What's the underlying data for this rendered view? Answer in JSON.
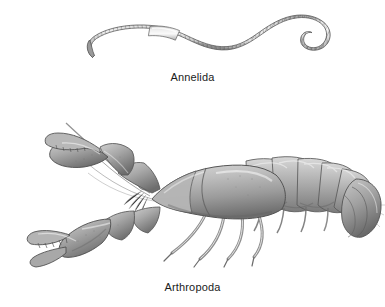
{
  "figure": {
    "kind": "biology-illustration-plate",
    "background_color": "#ffffff",
    "ink_color": "#1b1b1b",
    "panel_count": 2
  },
  "panels": [
    {
      "id": "annelida",
      "caption": "Annelida",
      "common_name": "earthworm",
      "icon_name": "earthworm-illustration",
      "orientation": "horizontal-sinusoid",
      "palette": {
        "body_light": "#e8e8e8",
        "body_mid": "#b4b4b4",
        "body_dark": "#7d7d7d",
        "outline": "#555555",
        "clitellum": "#f0f0f0"
      },
      "features": [
        "tapered anterior end at left",
        "annular ring segments along entire body",
        "smooth pale clitellum band near anterior third",
        "S-curved body",
        "hooked curled posterior tail at right"
      ]
    },
    {
      "id": "arthropoda",
      "caption": "Arthropoda",
      "common_name": "crayfish",
      "icon_name": "crayfish-illustration",
      "orientation": "lateral-facing-left",
      "palette": {
        "body_light": "#dcdcdc",
        "body_mid": "#a9a9a9",
        "body_dark": "#6e6e6e",
        "outline": "#4a4a4a",
        "eye": "#111111"
      },
      "features": [
        "two long sweeping antennae to upper left",
        "pair of large chelipeds with serrated pincers",
        "dark compound eye on stalk",
        "rounded carapace with cervical groove",
        "four pairs of slender walking legs",
        "six segmented abdomen with swimmerets",
        "fan-shaped telson and uropods at right"
      ]
    }
  ]
}
